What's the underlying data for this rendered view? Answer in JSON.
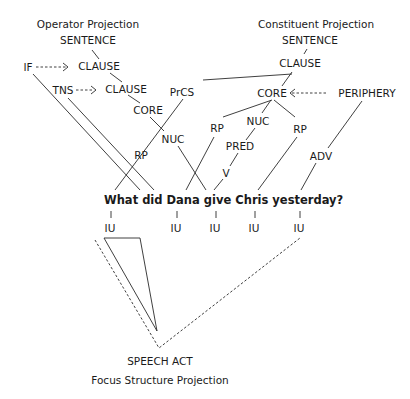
{
  "operator_projection": {
    "title": "Operator Projection",
    "sentence": "SENTENCE",
    "clause_1": "CLAUSE",
    "clause_2": "CLAUSE",
    "core": "CORE",
    "nuc": "NUC",
    "rp": "RP",
    "if": "IF",
    "tns": "TNS"
  },
  "constituent_projection": {
    "title": "Constituent Projection",
    "sentence": "SENTENCE",
    "clause": "CLAUSE",
    "prcs": "PrCS",
    "core": "CORE",
    "periphery": "PERIPHERY",
    "rp_1": "RP",
    "nuc": "NUC",
    "rp_2": "RP",
    "pred": "PRED",
    "v": "V",
    "adv": "ADV"
  },
  "sentence": "What did Dana give Chris yesterday?",
  "information_units": [
    "IU",
    "IU",
    "IU",
    "IU",
    "IU"
  ],
  "focus_structure": {
    "speech_act": "SPEECH ACT",
    "title": "Focus Structure Projection"
  }
}
